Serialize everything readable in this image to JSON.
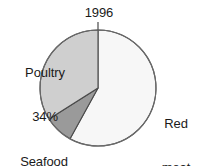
{
  "chart_data": {
    "type": "pie",
    "title": "1996",
    "xlabel": "",
    "ylabel": "",
    "legend_position": "none",
    "grid": false,
    "start_angle_deg": 0,
    "direction": "clockwise",
    "categories": [
      "Red meat",
      "Seafood",
      "Poultry"
    ],
    "values": [
      58,
      8,
      34
    ],
    "unit": "%",
    "slices": [
      {
        "name": "Red meat",
        "value": 58,
        "value_label": "58%",
        "label_lines": [
          "Red",
          "meat",
          "58%"
        ],
        "color": "#f7f7f7",
        "outline": "#4a4a4a",
        "label_position": "right"
      },
      {
        "name": "Seafood",
        "value": 8,
        "value_label": "8%",
        "label_lines": [
          "Seafood",
          "8%"
        ],
        "color": "#9a9a9a",
        "outline": "#4a4a4a",
        "label_position": "bottom-left"
      },
      {
        "name": "Poultry",
        "value": 34,
        "value_label": "34%",
        "label_lines": [
          "Poultry",
          "34%"
        ],
        "color": "#cfcfcf",
        "outline": "#4a4a4a",
        "label_position": "top-left"
      }
    ]
  },
  "chart": {
    "title": "1996",
    "background": "#ffffff",
    "outline_color": "#4a4a4a",
    "text_color": "#1a1a1a",
    "center_x": 98,
    "center_y": 88,
    "radius": 58
  },
  "labels": {
    "poultry": {
      "name": "Poultry",
      "percent": "34%"
    },
    "seafood": {
      "name": "Seafood",
      "percent": "8%"
    },
    "red_meat": {
      "name_line1": "Red",
      "name_line2": "meat",
      "percent": "58%"
    }
  }
}
